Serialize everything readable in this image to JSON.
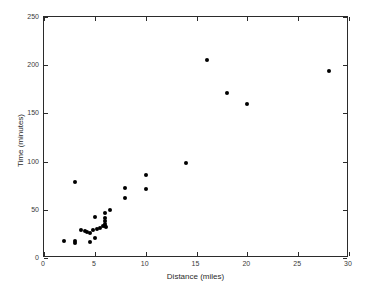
{
  "chart_data": {
    "type": "scatter",
    "title": "",
    "xlabel": "Distance (miles)",
    "ylabel": "Time (minutes)",
    "xlim": [
      0,
      30
    ],
    "ylim": [
      0,
      250
    ],
    "xticks": [
      0,
      5,
      10,
      15,
      20,
      25,
      30
    ],
    "yticks": [
      0,
      50,
      100,
      150,
      200,
      250
    ],
    "xtick_labels": [
      "0",
      "5",
      "10",
      "15",
      "20",
      "25",
      "30"
    ],
    "ytick_labels": [
      "0",
      "50",
      "100",
      "150",
      "200",
      "250"
    ],
    "grid": false,
    "legend": null,
    "marker": "filled-circle",
    "marker_color": "#000000",
    "points": [
      {
        "x": 2.0,
        "y": 18
      },
      {
        "x": 3.0,
        "y": 79
      },
      {
        "x": 3.0,
        "y": 18
      },
      {
        "x": 3.0,
        "y": 16
      },
      {
        "x": 3.6,
        "y": 29
      },
      {
        "x": 4.0,
        "y": 28
      },
      {
        "x": 4.2,
        "y": 27
      },
      {
        "x": 4.5,
        "y": 17
      },
      {
        "x": 4.5,
        "y": 26
      },
      {
        "x": 4.8,
        "y": 29
      },
      {
        "x": 5.0,
        "y": 43
      },
      {
        "x": 5.0,
        "y": 21
      },
      {
        "x": 5.2,
        "y": 30
      },
      {
        "x": 5.5,
        "y": 31
      },
      {
        "x": 5.8,
        "y": 33
      },
      {
        "x": 6.0,
        "y": 47
      },
      {
        "x": 6.0,
        "y": 41
      },
      {
        "x": 6.0,
        "y": 38
      },
      {
        "x": 6.0,
        "y": 35
      },
      {
        "x": 6.0,
        "y": 33
      },
      {
        "x": 6.1,
        "y": 32
      },
      {
        "x": 6.5,
        "y": 50
      },
      {
        "x": 8.0,
        "y": 73
      },
      {
        "x": 8.0,
        "y": 62
      },
      {
        "x": 10.0,
        "y": 86
      },
      {
        "x": 10.0,
        "y": 72
      },
      {
        "x": 14.0,
        "y": 99
      },
      {
        "x": 16.0,
        "y": 205
      },
      {
        "x": 18.0,
        "y": 171
      },
      {
        "x": 20.0,
        "y": 160
      },
      {
        "x": 28.0,
        "y": 194
      }
    ]
  }
}
